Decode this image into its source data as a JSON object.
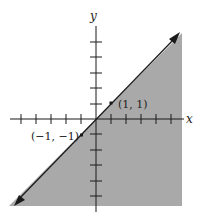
{
  "figure": {
    "type": "inequality-graph",
    "axes": {
      "x_label": "x",
      "y_label": "y",
      "tick_spacing_units": 1,
      "x_ticks": [
        -5,
        -4,
        -3,
        -2,
        -1,
        1,
        2,
        3,
        4,
        5
      ],
      "y_ticks": [
        -5,
        -4,
        -3,
        -2,
        -1,
        1,
        2,
        3,
        4,
        5
      ]
    },
    "boundary_line": {
      "equation": "y = x",
      "style": "solid",
      "arrows": "both"
    },
    "shaded_region": {
      "inequality": "y <= x",
      "color": "#a9a9a9"
    },
    "points": [
      {
        "label": "(1, 1)",
        "x": 1,
        "y": 1
      },
      {
        "label": "(−1, −1)",
        "x": -1,
        "y": -1
      }
    ],
    "colors": {
      "shade": "#a9a9a9",
      "ink": "#1a1a1a",
      "background": "#ffffff"
    }
  }
}
